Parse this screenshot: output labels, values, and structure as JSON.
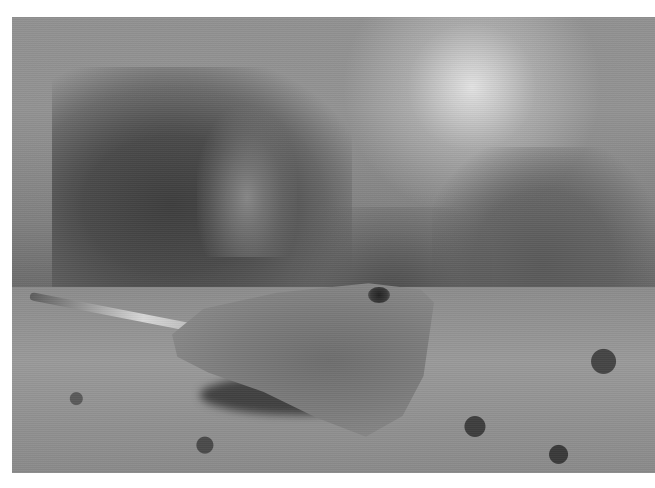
{
  "image": {
    "alt": "Grayscale underwater photograph of a stingray resting on a sandy seafloor in front of hazy coral reef and sea fans, with sunlight filtering from the surface",
    "subject": "stingray",
    "setting": "coral reef seafloor",
    "tone": "grayscale",
    "border_color": "#ffffff"
  }
}
